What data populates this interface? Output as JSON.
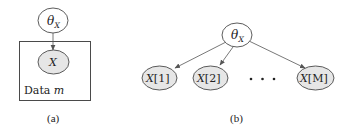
{
  "panel_a": {
    "caption": "(a)",
    "parameter_node": {
      "symbol": "θ",
      "subscript": "X"
    },
    "variable_node": {
      "label": "X"
    },
    "plate": {
      "label_text": "Data ",
      "label_index": "m"
    }
  },
  "panel_b": {
    "caption": "(b)",
    "parameter_node": {
      "symbol": "θ",
      "subscript": "X"
    },
    "instances": [
      {
        "var": "X",
        "index": "[1]"
      },
      {
        "var": "X",
        "index": "[2]"
      },
      {
        "var": "X",
        "index": "[M]"
      }
    ],
    "ellipsis": "· · ·"
  },
  "colors": {
    "shaded_fill": "#e6e6e6",
    "stroke": "#4a4a4a"
  }
}
